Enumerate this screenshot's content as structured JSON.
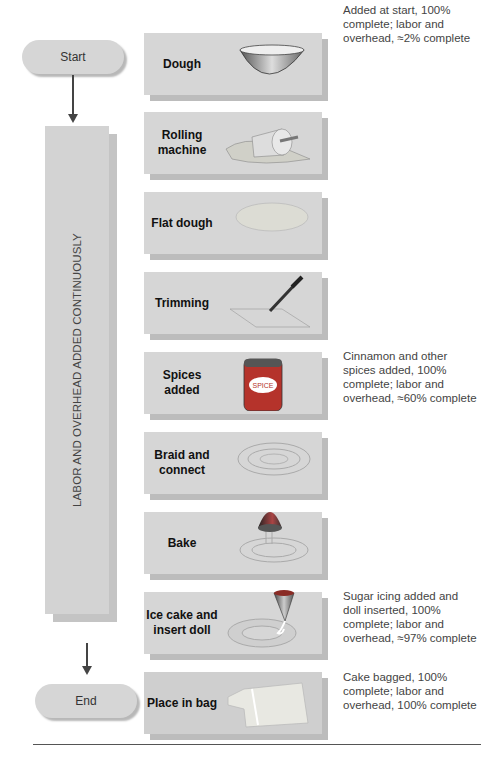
{
  "terminals": {
    "start": "Start",
    "end": "End"
  },
  "side_bar": {
    "label": "LABOR AND OVERHEAD ADDED CONTINUOUSLY"
  },
  "steps": [
    {
      "label": "Dough",
      "icon": "bowl-icon"
    },
    {
      "label": "Rolling machine",
      "icon": "rolling-pin-icon"
    },
    {
      "label": "Flat dough",
      "icon": "flat-dough-icon"
    },
    {
      "label": "Trimming",
      "icon": "knife-icon"
    },
    {
      "label": "Spices added",
      "icon": "spice-can-icon",
      "icon_text": "SPICE"
    },
    {
      "label": "Braid and connect",
      "icon": "braid-icon"
    },
    {
      "label": "Bake",
      "icon": "oven-cover-icon"
    },
    {
      "label": "Ice cake and insert doll",
      "icon": "icing-funnel-icon"
    },
    {
      "label": "Place in bag",
      "icon": "bag-icon"
    }
  ],
  "notes": [
    {
      "step": 0,
      "text": "Added at start, 100% complete; labor and overhead, ≈2% complete"
    },
    {
      "step": 4,
      "text": "Cinnamon and other spices added, 100% complete; labor and overhead, ≈60% complete"
    },
    {
      "step": 7,
      "text": "Sugar icing added and doll inserted, 100% complete; labor and overhead, ≈97% complete"
    },
    {
      "step": 8,
      "text": "Cake bagged, 100% complete; labor and overhead, 100% complete"
    }
  ],
  "colors": {
    "box": "#d6d6d6",
    "shadow": "#bcbcbc",
    "arrow": "#444444",
    "spice_can": "#b5332b"
  }
}
